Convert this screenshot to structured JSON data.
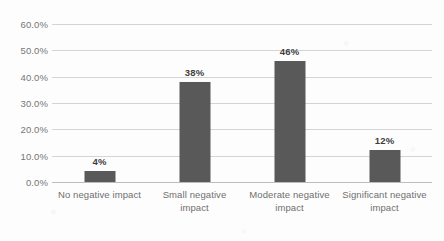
{
  "chart_data": {
    "type": "bar",
    "title": "",
    "subtitle": "",
    "xlabel": "",
    "ylabel": "",
    "categories": [
      "No negative impact",
      "Small negative impact",
      "Moderate negative impact",
      "Significant negative impact"
    ],
    "category_lines": [
      [
        "No negative impact",
        ""
      ],
      [
        "Small negative impact",
        ""
      ],
      [
        "Moderate negative",
        "impact"
      ],
      [
        "Significant negative",
        "impact"
      ]
    ],
    "values": [
      4,
      38,
      46,
      12
    ],
    "data_labels": [
      "4%",
      "38%",
      "46%",
      "12%"
    ],
    "ylim": [
      0,
      60
    ],
    "ytick_values": [
      60,
      50,
      40,
      30,
      20,
      10,
      0
    ],
    "ytick_labels": [
      "60.0%",
      "50.0%",
      "40.0%",
      "30.0%",
      "20.0%",
      "10.0%",
      "0.0%"
    ],
    "grid": true,
    "legend": false,
    "legend_position": "none",
    "bar_color": "#595959",
    "gridline_color": "#d4d4d4",
    "axis_color": "#bdbdbd",
    "label_color": "#6f6f6f",
    "data_label_color": "#3e3e3e",
    "background_color": "#fdfdfd"
  }
}
